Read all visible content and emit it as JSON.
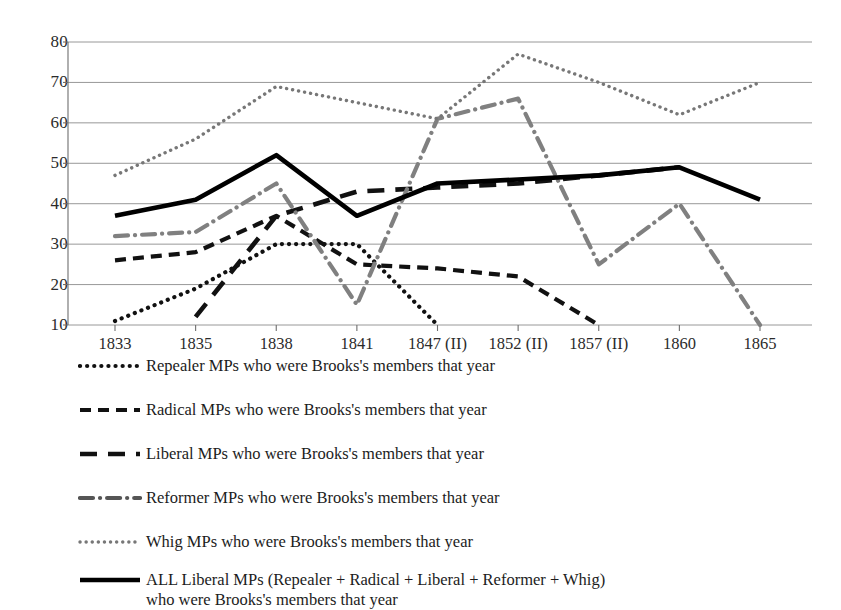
{
  "chart_data": {
    "type": "line",
    "title": "",
    "subtitle": "",
    "xlabel": "",
    "ylabel": "",
    "categories": [
      "1833",
      "1835",
      "1838",
      "1841",
      "1847 (II)",
      "1852 (II)",
      "1857 (II)",
      "1860",
      "1865"
    ],
    "ylim": [
      10,
      80
    ],
    "ytick_labels": [
      "10",
      "20",
      "30",
      "40",
      "50",
      "60",
      "70",
      "80"
    ],
    "ytick_values": [
      10,
      20,
      30,
      40,
      50,
      60,
      70,
      80
    ],
    "grid": true,
    "legend_position": "below",
    "series": [
      {
        "name": "Repealer MPs who were Brooks's members that year",
        "key": "repealer",
        "style": "dotted",
        "color": "#111111",
        "values": [
          11,
          19,
          30,
          30,
          10,
          null,
          null,
          null,
          null
        ]
      },
      {
        "name": "Radical MPs who were Brooks's members that year",
        "key": "radical",
        "style": "dashed",
        "color": "#111111",
        "values": [
          26,
          28,
          37,
          25,
          24,
          22,
          10,
          null,
          null
        ]
      },
      {
        "name": "Liberal MPs who were Brooks's members that year",
        "key": "liberal",
        "style": "long-dash",
        "color": "#111111",
        "values": [
          null,
          12,
          37,
          43,
          44,
          45,
          47,
          49,
          null
        ]
      },
      {
        "name": "Reformer MPs who were Brooks's members that year",
        "key": "reformer",
        "style": "dash-dot",
        "color": "#808080",
        "values": [
          32,
          33,
          45,
          15,
          61,
          66,
          25,
          40,
          10
        ]
      },
      {
        "name": "Whig MPs who were Brooks's members that year",
        "key": "whig",
        "style": "fine-dotted",
        "color": "#777777",
        "values": [
          47,
          56,
          69,
          65,
          61,
          77,
          70,
          62,
          70
        ]
      },
      {
        "name": "ALL Liberal MPs (Repealer + Radical + Liberal + Reformer + Whig) who were Brooks's members that year",
        "key": "all_liberal",
        "style": "solid",
        "color": "#000000",
        "values": [
          37,
          41,
          52,
          37,
          45,
          46,
          47,
          49,
          41
        ]
      }
    ]
  },
  "legend": {
    "items": [
      {
        "label": "Repealer MPs who were Brooks's members that year",
        "swatch": "dotted-line-swatch"
      },
      {
        "label": "Radical MPs who were Brooks's members that year",
        "swatch": "dashed-line-swatch"
      },
      {
        "label": "Liberal MPs who were Brooks's members that year",
        "swatch": "long-dash-line-swatch"
      },
      {
        "label": "Reformer MPs who were Brooks's members that year",
        "swatch": "dash-dot-line-swatch"
      },
      {
        "label": "Whig MPs who were Brooks's members that year",
        "swatch": "fine-dotted-line-swatch"
      },
      {
        "label": "ALL Liberal MPs (Repealer + Radical + Liberal + Reformer + Whig) who were Brooks's members that year",
        "swatch": "solid-line-swatch"
      }
    ]
  },
  "colors": {
    "axis": "#6e6e6e",
    "grid": "#8c8c8c",
    "text": "#1c1c1c",
    "gray_series": "#808080",
    "black_series": "#000000"
  }
}
